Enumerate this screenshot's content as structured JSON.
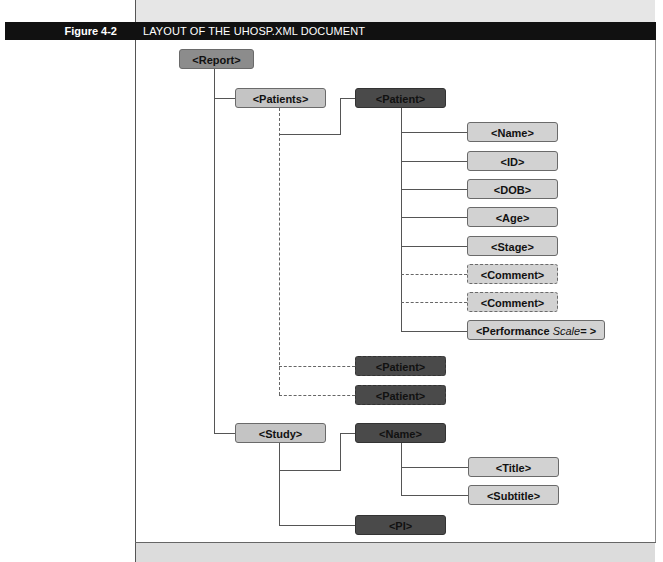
{
  "figure": {
    "label": "Figure 4-2",
    "title": "LAYOUT OF THE UHOSP.XML DOCUMENT"
  },
  "nodes": {
    "report": "<Report>",
    "patients": "<Patients>",
    "patient": "<Patient>",
    "name": "<Name>",
    "id": "<ID>",
    "dob": "<DOB>",
    "age": "<Age>",
    "stage": "<Stage>",
    "comment1": "<Comment>",
    "comment2": "<Comment>",
    "performance_prefix": "<Performance ",
    "performance_attr": "Scale",
    "performance_suffix": "= >",
    "patient_opt1": "<Patient>",
    "patient_opt2": "<Patient>",
    "study": "<Study>",
    "study_name": "<Name>",
    "title": "<Title>",
    "subtitle": "<Subtitle>",
    "pi": "<PI>"
  },
  "colors": {
    "title_bar": "#111111",
    "node_mid": "#8c8c8c",
    "node_light": "#c4c4c4",
    "node_dark": "#4a4a4a"
  }
}
